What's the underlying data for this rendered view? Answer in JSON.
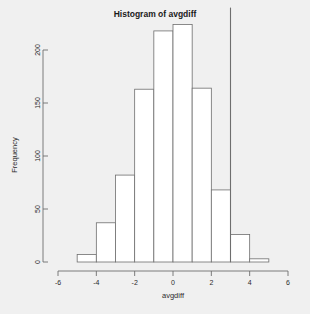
{
  "chart_data": {
    "type": "bar",
    "title": "Histogram of avgdiff",
    "xlabel": "avgdiff",
    "ylabel": "Frequency",
    "xlim": [
      -6,
      6
    ],
    "ylim": [
      0,
      240
    ],
    "grid": false,
    "legend": null,
    "bin_width": 1,
    "bin_edges": [
      -6,
      -5,
      -4,
      -3,
      -2,
      -1,
      0,
      1,
      2,
      3,
      4,
      5,
      6
    ],
    "categories": [
      "-6 to -5",
      "-5 to -4",
      "-4 to -3",
      "-3 to -2",
      "-2 to -1",
      "-1 to 0",
      "0 to 1",
      "1 to 2",
      "2 to 3",
      "3 to 4",
      "4 to 5",
      "5 to 6"
    ],
    "values": [
      0,
      7,
      37,
      82,
      163,
      218,
      224,
      164,
      68,
      26,
      3,
      0
    ],
    "xticks": [
      -6,
      -4,
      -2,
      0,
      2,
      4,
      6
    ],
    "xticklabels": [
      "-6",
      "-4",
      "-2",
      "0",
      "2",
      "4",
      "6"
    ],
    "yticks": [
      0,
      50,
      100,
      150,
      200
    ],
    "yticklabels": [
      "0",
      "50",
      "100",
      "150",
      "200"
    ],
    "annotations": [
      {
        "name": "reference-line",
        "type": "vline",
        "x": 3,
        "y_top": 240,
        "color": "#6e6e6e"
      }
    ],
    "colors": {
      "bar_fill": "#ffffff",
      "bar_stroke": "#6e6e6e",
      "axis": "#6e6e6e",
      "text": "#2b2b2b",
      "title": "#1a1a1a",
      "background": "#f0f0f0"
    }
  }
}
